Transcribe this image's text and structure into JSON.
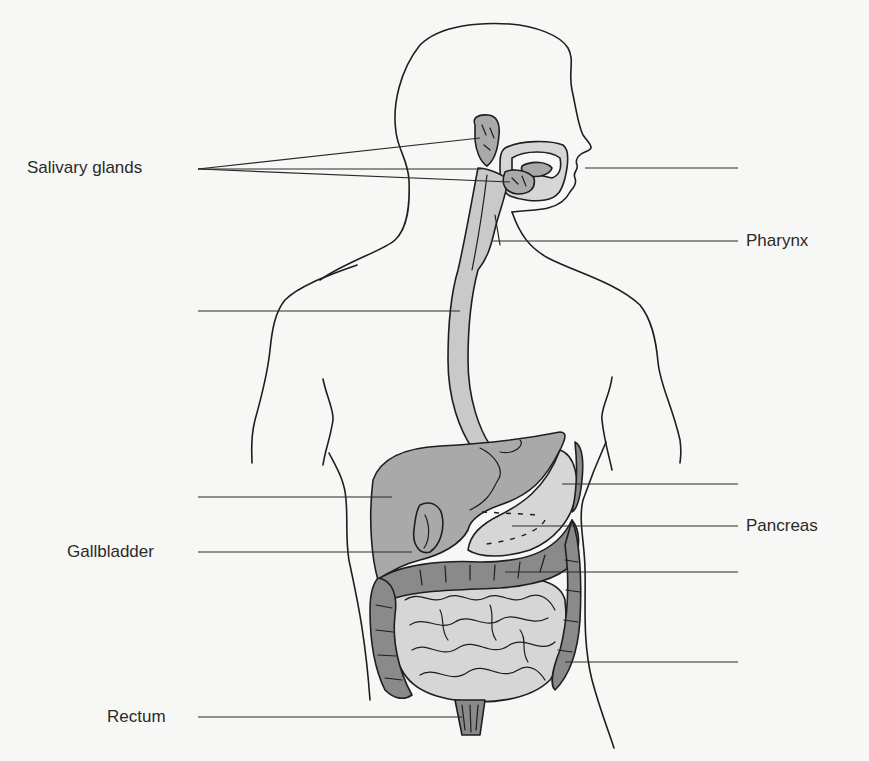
{
  "diagram": {
    "colors": {
      "background": "#f7f7f5",
      "outline": "#1e1e1e",
      "light_fill": "#d6d6d6",
      "mid_fill": "#a9a9a9",
      "dark_fill": "#8a8a8a"
    },
    "labels": {
      "salivary_glands": "Salivary glands",
      "pharynx": "Pharynx",
      "pancreas": "Pancreas",
      "gallbladder": "Gallbladder",
      "rectum": "Rectum"
    },
    "blank_leaders": {
      "left": [
        "esophagus (blank)",
        "liver (blank)"
      ],
      "right": [
        "mouth (blank)",
        "stomach (blank)",
        "large intestine (blank)",
        "small intestine (blank)"
      ]
    }
  }
}
